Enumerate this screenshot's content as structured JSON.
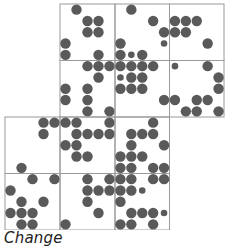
{
  "caption": "Change",
  "colors": {
    "dot": "#5a5a5a",
    "grid": "#9a9a9a",
    "background": "#ffffff"
  },
  "legend_of_values": {
    "0": "empty",
    "1": "small dot",
    "2": "large dot"
  },
  "cells": [
    {
      "row": 0,
      "col": 1,
      "dots": [
        [
          0,
          2,
          0,
          0,
          0
        ],
        [
          0,
          0,
          2,
          2,
          0
        ],
        [
          0,
          0,
          2,
          2,
          0
        ],
        [
          2,
          0,
          0,
          0,
          0
        ],
        [
          2,
          0,
          0,
          2,
          0
        ]
      ]
    },
    {
      "row": 0,
      "col": 2,
      "dots": [
        [
          0,
          2,
          0,
          0,
          0
        ],
        [
          0,
          0,
          0,
          2,
          0
        ],
        [
          0,
          0,
          0,
          0,
          2
        ],
        [
          2,
          0,
          0,
          0,
          1
        ],
        [
          2,
          1,
          2,
          0,
          0
        ]
      ]
    },
    {
      "row": 0,
      "col": 3,
      "dots": [
        [
          0,
          0,
          0,
          0,
          0
        ],
        [
          2,
          2,
          2,
          0,
          0
        ],
        [
          2,
          2,
          0,
          0,
          0
        ],
        [
          0,
          0,
          0,
          2,
          0
        ],
        [
          0,
          0,
          0,
          0,
          0
        ]
      ]
    },
    {
      "row": 1,
      "col": 1,
      "dots": [
        [
          0,
          0,
          2,
          2,
          2
        ],
        [
          0,
          0,
          0,
          2,
          0
        ],
        [
          2,
          0,
          2,
          0,
          0
        ],
        [
          2,
          0,
          2,
          0,
          0
        ],
        [
          0,
          0,
          2,
          0,
          2
        ]
      ]
    },
    {
      "row": 1,
      "col": 2,
      "dots": [
        [
          2,
          2,
          2,
          2,
          0
        ],
        [
          1,
          2,
          2,
          0,
          0
        ],
        [
          2,
          2,
          2,
          0,
          0
        ],
        [
          0,
          0,
          0,
          0,
          2
        ],
        [
          0,
          0,
          0,
          0,
          0
        ]
      ]
    },
    {
      "row": 1,
      "col": 3,
      "dots": [
        [
          1,
          0,
          0,
          2,
          0
        ],
        [
          0,
          0,
          0,
          0,
          2
        ],
        [
          0,
          0,
          0,
          0,
          2
        ],
        [
          2,
          0,
          2,
          2,
          0
        ],
        [
          0,
          2,
          2,
          0,
          2
        ]
      ]
    },
    {
      "row": 2,
      "col": 0,
      "dots": [
        [
          0,
          0,
          0,
          2,
          2
        ],
        [
          0,
          0,
          0,
          2,
          0
        ],
        [
          0,
          0,
          0,
          0,
          0
        ],
        [
          0,
          0,
          0,
          0,
          0
        ],
        [
          0,
          2,
          0,
          0,
          0
        ]
      ]
    },
    {
      "row": 2,
      "col": 1,
      "dots": [
        [
          2,
          2,
          0,
          0,
          2
        ],
        [
          0,
          2,
          2,
          2,
          2
        ],
        [
          2,
          2,
          0,
          0,
          0
        ],
        [
          0,
          2,
          2,
          0,
          0
        ],
        [
          0,
          0,
          0,
          0,
          0
        ]
      ]
    },
    {
      "row": 2,
      "col": 2,
      "dots": [
        [
          0,
          0,
          0,
          2,
          0
        ],
        [
          0,
          2,
          2,
          2,
          0
        ],
        [
          0,
          2,
          0,
          0,
          2
        ],
        [
          2,
          2,
          2,
          0,
          0
        ],
        [
          2,
          2,
          0,
          2,
          2
        ]
      ]
    },
    {
      "row": 3,
      "col": 0,
      "dots": [
        [
          0,
          0,
          2,
          0,
          2
        ],
        [
          2,
          0,
          0,
          0,
          0
        ],
        [
          0,
          2,
          0,
          2,
          0
        ],
        [
          2,
          2,
          2,
          0,
          0
        ],
        [
          0,
          2,
          2,
          0,
          0
        ]
      ]
    },
    {
      "row": 3,
      "col": 1,
      "dots": [
        [
          0,
          0,
          2,
          0,
          2
        ],
        [
          0,
          0,
          2,
          2,
          2
        ],
        [
          0,
          0,
          2,
          0,
          0
        ],
        [
          0,
          0,
          0,
          2,
          0
        ],
        [
          2,
          0,
          0,
          0,
          0
        ]
      ]
    },
    {
      "row": 3,
      "col": 2,
      "dots": [
        [
          2,
          2,
          0,
          2,
          2
        ],
        [
          2,
          2,
          1,
          0,
          0
        ],
        [
          2,
          0,
          0,
          0,
          0
        ],
        [
          0,
          2,
          2,
          2,
          1
        ],
        [
          2,
          2,
          0,
          2,
          0
        ]
      ]
    }
  ]
}
